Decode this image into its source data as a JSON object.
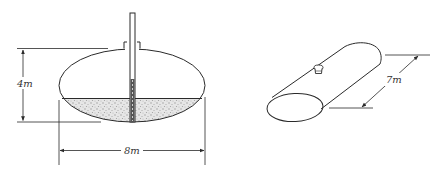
{
  "figures": {
    "front_view": {
      "description": "Elliptical tank cross-section with dipstick and liquid",
      "height_label": "4m",
      "width_label": "8m"
    },
    "iso_view": {
      "description": "Isometric view of horizontal elliptical tank with fill cap",
      "length_label": "7m"
    }
  },
  "colors": {
    "line": "#2a2a2a",
    "liquid_fill": "#d9d9d9",
    "background": "#ffffff"
  }
}
